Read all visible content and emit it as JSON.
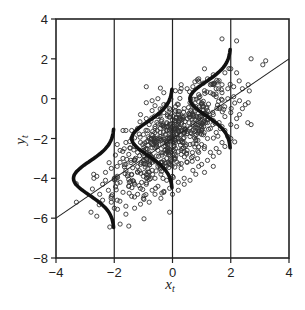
{
  "chart_data": {
    "type": "scatter",
    "title": "",
    "xlabel": "x",
    "xlabel_subscript": "t",
    "ylabel": "y",
    "ylabel_subscript": "t",
    "xlim": [
      -4,
      4
    ],
    "ylim": [
      -8,
      4
    ],
    "xticks": [
      -4,
      -2,
      0,
      2,
      4
    ],
    "yticks": [
      4,
      2,
      0,
      -2,
      -4,
      -6,
      -8
    ],
    "xtick_labels": [
      "−4",
      "−2",
      "0",
      "2",
      "4"
    ],
    "ytick_labels": [
      "4",
      "2",
      "0",
      "−2",
      "−4",
      "−6",
      "−8"
    ],
    "grid": false,
    "legend": null,
    "vertical_lines_x": [
      -2,
      0,
      2
    ],
    "regression_line": {
      "slope": 1,
      "intercept": -2,
      "x_range": [
        -4,
        4
      ]
    },
    "conditional_densities": [
      {
        "at_x": -2,
        "mean_y": -4,
        "sd": 0.85,
        "peak_width": 1.4
      },
      {
        "at_x": 0,
        "mean_y": -2,
        "sd": 0.85,
        "peak_width": 1.4
      },
      {
        "at_x": 2,
        "mean_y": 0,
        "sd": 0.85,
        "peak_width": 1.4
      }
    ],
    "scatter_points": [
      [
        1.7,
        3.0
      ],
      [
        2.2,
        2.9
      ],
      [
        2.7,
        2.0
      ],
      [
        3.2,
        1.9
      ],
      [
        3.1,
        1.7
      ],
      [
        -0.9,
        0.6
      ],
      [
        2.0,
        1.5
      ],
      [
        2.2,
        1.3
      ],
      [
        2.6,
        0.7
      ],
      [
        2.4,
        0.5
      ],
      [
        2.7,
        -1.3
      ],
      [
        2.2,
        -1.4
      ],
      [
        1.4,
        -3.4
      ],
      [
        1.1,
        -3.7
      ],
      [
        -0.1,
        -5.7
      ],
      [
        -1.8,
        -6.3
      ],
      [
        -1.5,
        -6.4
      ],
      [
        -2.8,
        -5.7
      ],
      [
        -2.6,
        -5.9
      ],
      [
        -3.3,
        -5.2
      ],
      [
        -2.1,
        -5.2
      ],
      [
        -1.6,
        -5.8
      ],
      [
        -1.3,
        -5.5
      ],
      [
        -2.5,
        -4.8
      ],
      [
        -2.4,
        -4.3
      ],
      [
        -2.7,
        -4.0
      ],
      [
        -2.3,
        -4.1
      ],
      [
        -2.0,
        -4.0
      ],
      [
        -1.9,
        -3.9
      ],
      [
        -2.6,
        -3.9
      ],
      [
        -1.7,
        -1.6
      ],
      [
        -1.6,
        -1.6
      ],
      [
        -1.4,
        -1.6
      ],
      [
        -1.9,
        -2.3
      ],
      [
        -1.8,
        -2.6
      ],
      [
        -1.6,
        -2.2
      ],
      [
        -0.9,
        -0.2
      ],
      [
        -0.7,
        -0.1
      ],
      [
        -0.5,
        0.0
      ],
      [
        -0.3,
        0.3
      ],
      [
        0.1,
        0.4
      ],
      [
        0.3,
        0.7
      ],
      [
        0.5,
        0.5
      ],
      [
        0.7,
        0.6
      ],
      [
        0.9,
        1.0
      ],
      [
        1.1,
        1.5
      ],
      [
        1.2,
        1.0
      ],
      [
        1.4,
        1.2
      ],
      [
        1.6,
        0.9
      ],
      [
        1.8,
        1.3
      ],
      [
        1.3,
        0.3
      ],
      [
        1.5,
        0.1
      ],
      [
        1.7,
        0.3
      ],
      [
        1.9,
        0.0
      ],
      [
        2.1,
        0.1
      ],
      [
        2.3,
        -0.1
      ],
      [
        2.5,
        -0.3
      ],
      [
        1.0,
        -0.2
      ],
      [
        0.8,
        -0.4
      ],
      [
        0.6,
        -0.2
      ],
      [
        0.4,
        -0.5
      ],
      [
        0.2,
        -0.3
      ],
      [
        1.2,
        -0.6
      ],
      [
        1.4,
        -0.8
      ],
      [
        1.6,
        -0.5
      ],
      [
        1.8,
        -0.9
      ],
      [
        2.0,
        -0.7
      ],
      [
        2.2,
        -1.0
      ],
      [
        1.1,
        -1.1
      ],
      [
        0.9,
        -0.9
      ],
      [
        0.7,
        -1.2
      ],
      [
        0.5,
        -1.0
      ],
      [
        0.3,
        -1.3
      ],
      [
        0.1,
        -1.1
      ],
      [
        -0.1,
        -0.9
      ],
      [
        -0.3,
        -0.7
      ],
      [
        -0.5,
        -0.9
      ],
      [
        -0.7,
        -0.6
      ],
      [
        -0.9,
        -1.0
      ],
      [
        -1.1,
        -0.8
      ],
      [
        1.3,
        -1.5
      ],
      [
        1.5,
        -1.7
      ],
      [
        1.7,
        -1.4
      ],
      [
        1.9,
        -1.9
      ],
      [
        1.2,
        -2.0
      ],
      [
        1.0,
        -1.8
      ],
      [
        0.8,
        -1.6
      ],
      [
        0.6,
        -1.9
      ],
      [
        0.4,
        -1.7
      ],
      [
        0.2,
        -2.0
      ],
      [
        0.0,
        -1.8
      ],
      [
        -0.2,
        -1.6
      ],
      [
        -0.4,
        -1.9
      ],
      [
        -0.6,
        -1.7
      ],
      [
        -0.8,
        -2.0
      ],
      [
        -1.0,
        -1.8
      ],
      [
        -1.2,
        -1.5
      ],
      [
        -1.4,
        -2.0
      ],
      [
        -1.3,
        -2.4
      ],
      [
        -1.1,
        -2.2
      ],
      [
        -0.9,
        -2.5
      ],
      [
        -0.7,
        -2.3
      ],
      [
        -0.5,
        -2.6
      ],
      [
        -0.3,
        -2.4
      ],
      [
        -0.1,
        -2.7
      ],
      [
        0.1,
        -2.5
      ],
      [
        0.3,
        -2.8
      ],
      [
        0.5,
        -2.6
      ],
      [
        0.7,
        -2.9
      ],
      [
        0.9,
        -2.7
      ],
      [
        1.1,
        -2.4
      ],
      [
        1.3,
        -2.7
      ],
      [
        1.5,
        -2.5
      ],
      [
        1.7,
        -2.2
      ],
      [
        -1.5,
        -2.8
      ],
      [
        -1.7,
        -3.0
      ],
      [
        -1.3,
        -3.1
      ],
      [
        -1.1,
        -3.3
      ],
      [
        -0.9,
        -3.0
      ],
      [
        -0.7,
        -3.2
      ],
      [
        -0.5,
        -3.4
      ],
      [
        -0.3,
        -3.1
      ],
      [
        -0.1,
        -3.3
      ],
      [
        0.1,
        -3.0
      ],
      [
        0.3,
        -3.5
      ],
      [
        0.5,
        -3.2
      ],
      [
        0.7,
        -3.6
      ],
      [
        0.9,
        -3.4
      ],
      [
        -1.9,
        -3.4
      ],
      [
        -1.6,
        -3.6
      ],
      [
        -1.4,
        -3.8
      ],
      [
        -1.2,
        -3.7
      ],
      [
        -1.0,
        -3.9
      ],
      [
        -0.8,
        -3.7
      ],
      [
        -0.6,
        -4.0
      ],
      [
        -0.4,
        -3.8
      ],
      [
        -0.2,
        -4.1
      ],
      [
        0.0,
        -3.9
      ],
      [
        0.2,
        -4.2
      ],
      [
        0.4,
        -4.0
      ],
      [
        -1.8,
        -4.2
      ],
      [
        -1.5,
        -4.4
      ],
      [
        -1.3,
        -4.3
      ],
      [
        -1.1,
        -4.5
      ],
      [
        -0.9,
        -4.3
      ],
      [
        -0.7,
        -4.6
      ],
      [
        -0.5,
        -4.4
      ],
      [
        -0.3,
        -4.7
      ],
      [
        -0.1,
        -4.5
      ],
      [
        -1.7,
        -4.7
      ],
      [
        -1.4,
        -4.9
      ],
      [
        -1.2,
        -4.8
      ],
      [
        -1.0,
        -5.0
      ],
      [
        -0.8,
        -5.2
      ],
      [
        -2.2,
        -4.6
      ],
      [
        -2.1,
        -4.9
      ],
      [
        -1.9,
        -5.1
      ],
      [
        -2.3,
        -3.7
      ],
      [
        -2.1,
        -3.5
      ],
      [
        -1.8,
        -3.2
      ],
      [
        -0.2,
        -1.2
      ],
      [
        0.0,
        -1.4
      ],
      [
        0.2,
        -1.6
      ],
      [
        -0.4,
        -1.3
      ],
      [
        -0.6,
        -1.4
      ],
      [
        -0.8,
        -1.3
      ],
      [
        0.4,
        -2.2
      ],
      [
        0.6,
        -2.3
      ],
      [
        0.8,
        -2.1
      ],
      [
        1.0,
        -2.3
      ],
      [
        -0.2,
        -2.2
      ],
      [
        -0.4,
        -2.1
      ],
      [
        -0.6,
        -2.2
      ],
      [
        -0.1,
        -2.0
      ],
      [
        0.1,
        -2.2
      ],
      [
        0.3,
        -2.1
      ],
      [
        -1.2,
        -2.7
      ],
      [
        -1.0,
        -2.6
      ],
      [
        -0.8,
        -2.8
      ],
      [
        -1.6,
        -3.3
      ],
      [
        0.6,
        -0.8
      ],
      [
        0.8,
        -1.3
      ],
      [
        1.0,
        -1.4
      ],
      [
        1.2,
        -1.2
      ],
      [
        1.4,
        -1.1
      ],
      [
        1.6,
        -1.2
      ],
      [
        1.8,
        -1.6
      ],
      [
        2.0,
        -1.3
      ],
      [
        0.2,
        -0.8
      ],
      [
        0.4,
        -0.9
      ],
      [
        -0.3,
        -0.3
      ],
      [
        -0.1,
        -0.5
      ],
      [
        0.1,
        -0.6
      ],
      [
        1.5,
        0.5
      ],
      [
        1.3,
        0.7
      ],
      [
        1.1,
        0.4
      ],
      [
        0.9,
        0.2
      ],
      [
        1.7,
        0.7
      ],
      [
        1.9,
        0.5
      ],
      [
        2.1,
        0.6
      ],
      [
        2.4,
        -0.5
      ],
      [
        2.3,
        -0.8
      ],
      [
        2.6,
        -0.2
      ],
      [
        2.0,
        -2.0
      ],
      [
        1.8,
        -2.4
      ],
      [
        1.6,
        -2.7
      ],
      [
        1.4,
        -2.9
      ],
      [
        1.2,
        -3.1
      ],
      [
        1.0,
        -3.3
      ],
      [
        0.8,
        -3.8
      ],
      [
        0.6,
        -4.1
      ],
      [
        0.4,
        -4.3
      ],
      [
        0.2,
        -4.6
      ],
      [
        -0.4,
        -5.0
      ],
      [
        -0.6,
        -4.8
      ],
      [
        -1.6,
        -5.4
      ],
      [
        -2.4,
        -5.1
      ],
      [
        -2.0,
        -5.5
      ],
      [
        -1.1,
        -5.3
      ],
      [
        0.0,
        -4.8
      ]
    ],
    "n_points_approx": 700
  },
  "layout": {
    "plot_px": {
      "left": 56,
      "right": 289,
      "top": 19,
      "bottom": 258
    },
    "colors": {
      "axis": "#222222",
      "points": "#333333",
      "curve": "#111111",
      "line": "#222222",
      "background": "#ffffff"
    }
  }
}
